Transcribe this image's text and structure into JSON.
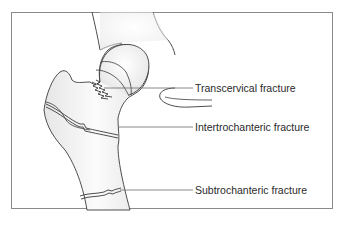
{
  "diagram": {
    "labels": [
      {
        "id": "transcervical",
        "text": "Transcervical fracture"
      },
      {
        "id": "intertrochanteric",
        "text": "Intertrochanteric fracture"
      },
      {
        "id": "subtrochanteric",
        "text": "Subtrochanteric fracture"
      }
    ],
    "colors": {
      "outline": "#3a3a3a",
      "leader": "#6a6a6a",
      "bone_fill": "#f2f2f2",
      "border": "#8a8a8a"
    }
  }
}
